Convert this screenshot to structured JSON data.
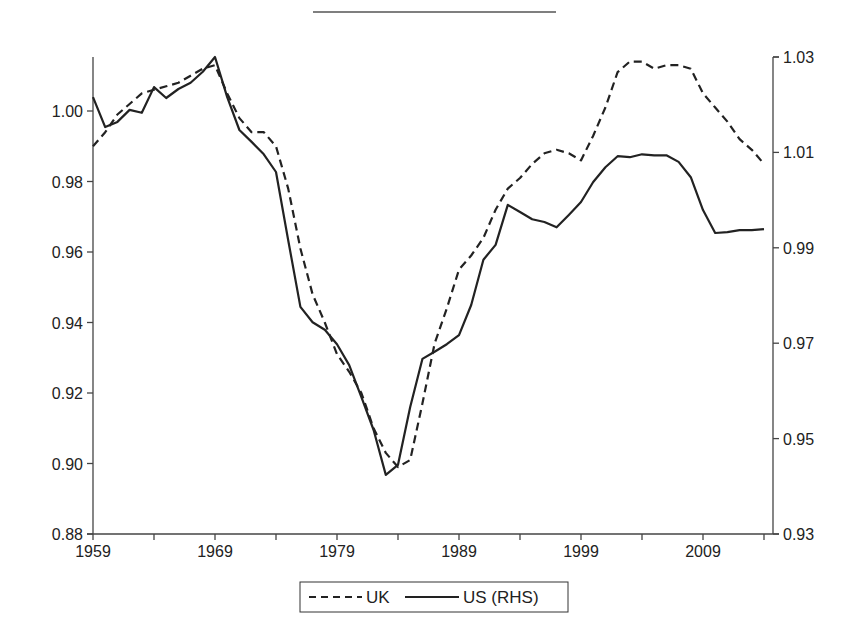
{
  "header": {
    "rule": "top-decorative-rule"
  },
  "legend": {
    "items": [
      {
        "label": "UK",
        "style": "dashed"
      },
      {
        "label": "US (RHS)",
        "style": "solid"
      }
    ]
  },
  "colors": {
    "line": "#222222",
    "axis": "#444444",
    "background": "#ffffff"
  },
  "chart_data": {
    "type": "line",
    "title": "",
    "xlabel": "",
    "ylabel": "",
    "y2label": "",
    "x": [
      1959,
      1960,
      1961,
      1962,
      1963,
      1964,
      1965,
      1966,
      1967,
      1968,
      1969,
      1970,
      1971,
      1972,
      1973,
      1974,
      1975,
      1976,
      1977,
      1978,
      1979,
      1980,
      1981,
      1982,
      1983,
      1984,
      1985,
      1986,
      1987,
      1988,
      1989,
      1990,
      1991,
      1992,
      1993,
      1994,
      1995,
      1996,
      1997,
      1998,
      1999,
      2000,
      2001,
      2002,
      2003,
      2004,
      2005,
      2006,
      2007,
      2008,
      2009,
      2010,
      2011,
      2012,
      2013,
      2014
    ],
    "x_ticks": [
      "1959",
      "1969",
      "1979",
      "1989",
      "1999",
      "2009"
    ],
    "xlim": [
      1959,
      2014.7
    ],
    "ylim": [
      0.88,
      1.015
    ],
    "y_ticks": [
      "0.88",
      "0.90",
      "0.92",
      "0.94",
      "0.96",
      "0.98",
      "1.00"
    ],
    "y2lim": [
      0.93,
      1.03
    ],
    "y2_ticks": [
      "0.93",
      "0.95",
      "0.97",
      "0.99",
      "1.01",
      "1.03"
    ],
    "grid": false,
    "legend_position": "bottom",
    "series": [
      {
        "name": "UK",
        "axis": "left",
        "style": "dashed",
        "values": [
          0.99,
          0.994,
          0.999,
          1.002,
          1.005,
          1.006,
          1.007,
          1.008,
          1.01,
          1.012,
          1.013,
          1.005,
          0.998,
          0.994,
          0.994,
          0.99,
          0.978,
          0.961,
          0.948,
          0.94,
          0.931,
          0.926,
          0.92,
          0.91,
          0.903,
          0.899,
          0.901,
          0.917,
          0.934,
          0.944,
          0.955,
          0.959,
          0.964,
          0.972,
          0.978,
          0.981,
          0.985,
          0.988,
          0.989,
          0.988,
          0.986,
          0.993,
          1.001,
          1.011,
          1.014,
          1.014,
          1.012,
          1.013,
          1.013,
          1.012,
          1.005,
          1.001,
          0.997,
          0.992,
          0.989,
          0.985
        ]
      },
      {
        "name": "US (RHS)",
        "axis": "right",
        "style": "solid",
        "values": [
          1.0216,
          1.0153,
          1.0164,
          1.0189,
          1.0183,
          1.0237,
          1.0214,
          1.0233,
          1.0246,
          1.0269,
          1.03,
          1.0216,
          1.0147,
          1.0122,
          1.0096,
          1.0059,
          0.9916,
          0.9776,
          0.9744,
          0.9728,
          0.9698,
          0.9654,
          0.9587,
          0.9518,
          0.9424,
          0.9445,
          0.9566,
          0.9667,
          0.9682,
          0.9698,
          0.9717,
          0.978,
          0.9875,
          0.9906,
          0.999,
          0.9975,
          0.996,
          0.9954,
          0.9943,
          0.9969,
          0.9996,
          1.0038,
          1.0069,
          1.0092,
          1.009,
          1.0096,
          1.0094,
          1.0094,
          1.008,
          1.0048,
          0.9979,
          0.9931,
          0.9933,
          0.9937,
          0.9937,
          0.9939
        ]
      }
    ]
  }
}
